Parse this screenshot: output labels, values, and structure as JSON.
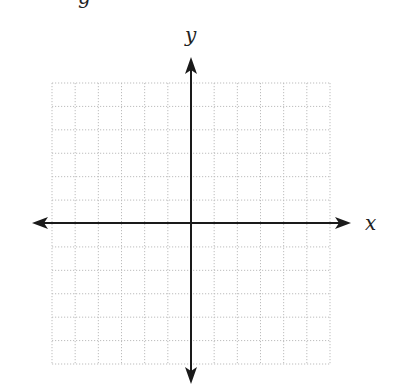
{
  "diagram": {
    "type": "coordinate-plane",
    "x_axis_label": "x",
    "y_axis_label": "y",
    "top_cut_glyph": "g",
    "grid": {
      "columns": 12,
      "rows": 12,
      "cells_left_of_y_axis": 6,
      "cells_right_of_y_axis": 6,
      "cells_above_x_axis": 6,
      "cells_below_x_axis": 6,
      "line_style": "dotted",
      "line_color": "#bdbdbd"
    },
    "axis_color": "#1a1a1a",
    "arrows": [
      "left",
      "right",
      "up",
      "down"
    ]
  }
}
